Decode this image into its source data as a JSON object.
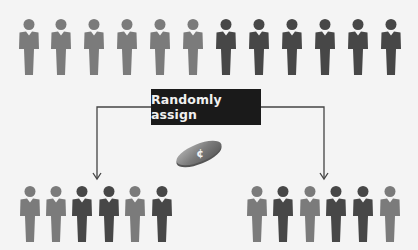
{
  "colors": {
    "light": "#7b7b7b",
    "dark": "#474747",
    "background": "#f4f4f4",
    "box": "#1a1a1a",
    "line": "#444444"
  },
  "label": "Randomly assign",
  "coin": {
    "icon": "coin-icon",
    "glyph": "¢"
  },
  "population": {
    "count": 12,
    "types": [
      "light",
      "light",
      "light",
      "light",
      "light",
      "light",
      "dark",
      "dark",
      "dark",
      "dark",
      "dark",
      "dark"
    ],
    "x": [
      18,
      50,
      83,
      116,
      149,
      182,
      215,
      248,
      281,
      314,
      347,
      380
    ],
    "y": 19
  },
  "group_a": {
    "count": 6,
    "types": [
      "light",
      "light",
      "dark",
      "dark",
      "light",
      "dark"
    ],
    "x": [
      19,
      45,
      71,
      98,
      124,
      151
    ],
    "y": 186
  },
  "group_b": {
    "count": 6,
    "types": [
      "light",
      "dark",
      "light",
      "dark",
      "dark",
      "light"
    ],
    "x": [
      246,
      272,
      299,
      325,
      352,
      379
    ],
    "y": 186
  }
}
